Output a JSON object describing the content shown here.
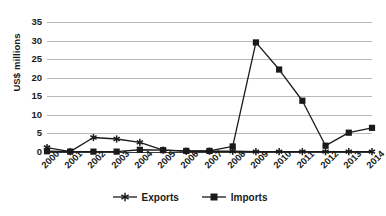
{
  "chart_data": {
    "type": "line",
    "title": "",
    "xlabel": "",
    "ylabel": "US$ millions",
    "categories": [
      "2000",
      "2001",
      "2002",
      "2003",
      "2004",
      "2005",
      "2006",
      "2007",
      "2008",
      "2009",
      "2010",
      "2011",
      "2012",
      "2013",
      "2014"
    ],
    "series": [
      {
        "name": "Exports",
        "marker": "asterisk",
        "color": "#1a1a1a",
        "values": [
          1.2,
          0.1,
          3.9,
          3.5,
          2.6,
          0.5,
          0.2,
          0.2,
          0.2,
          0.1,
          0.1,
          0.1,
          0.1,
          0.1,
          0.1
        ]
      },
      {
        "name": "Imports",
        "marker": "square",
        "color": "#1a1a1a",
        "values": [
          0.2,
          0.1,
          0.1,
          0.1,
          0.6,
          0.5,
          0.3,
          0.3,
          1.5,
          29.5,
          22.2,
          13.8,
          1.7,
          5.2,
          6.5
        ]
      }
    ],
    "ylim": [
      0,
      35
    ],
    "yticks": [
      0,
      5,
      10,
      15,
      20,
      25,
      30,
      35
    ],
    "ytick_labels": [
      "0",
      "5",
      "10",
      "15",
      "20",
      "25",
      "30",
      "35"
    ],
    "grid": true,
    "grid_axis": "y",
    "grid_color": "#b9b9b9",
    "legend_position": "bottom",
    "background": "#ffffff",
    "axis_color": "#3a3a3a"
  },
  "legend": {
    "items": [
      {
        "label": "Exports",
        "marker": "asterisk-marker"
      },
      {
        "label": "Imports",
        "marker": "square-marker"
      }
    ]
  }
}
